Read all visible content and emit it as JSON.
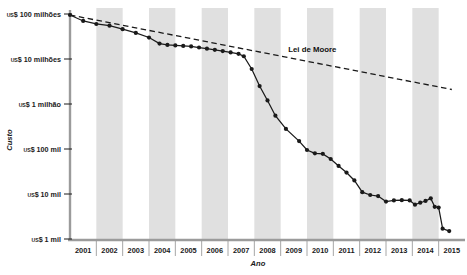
{
  "chart_data": {
    "type": "line",
    "title": "",
    "xlabel": "Ano",
    "ylabel": "Custo",
    "log_scale_y": true,
    "grid": false,
    "legend_position": "inline-annotation",
    "xlim": [
      2001,
      2015
    ],
    "ylim": [
      1000,
      100000000
    ],
    "x_tick_labels": [
      "2001",
      "2002",
      "2003",
      "2004",
      "2005",
      "2006",
      "2007",
      "2008",
      "2009",
      "2010",
      "2011",
      "2012",
      "2013",
      "2014",
      "2015"
    ],
    "y_tick_labels": [
      "US$ 100 milhões",
      "US$ 10 milhões",
      "US$ 1 milhão",
      "US$ 100 mil",
      "US$ 10 mil",
      "US$ 1 mil"
    ],
    "y_tick_values": [
      100000000,
      10000000,
      1000000,
      100000,
      10000,
      1000
    ],
    "y_tick_prefix": "US$",
    "y_tick_suffixes": [
      "100 milhões",
      "10 milhões",
      "1 milhão",
      "100 mil",
      "10 mil",
      "1 mil"
    ],
    "shaded_band_years": [
      "2002",
      "2004",
      "2006",
      "2008",
      "2010",
      "2012",
      "2014"
    ],
    "annotations": [
      {
        "text": "Lei de Moore",
        "x": 2010.2,
        "y": 14000000
      }
    ],
    "series": [
      {
        "name": "Custo do sequenciamento de genoma",
        "style": "line-markers",
        "color": "#1a1a1a",
        "points": [
          {
            "x": 2001.0,
            "y": 95000000
          },
          {
            "x": 2001.5,
            "y": 70000000
          },
          {
            "x": 2002.0,
            "y": 60000000
          },
          {
            "x": 2002.5,
            "y": 55000000
          },
          {
            "x": 2003.0,
            "y": 46000000
          },
          {
            "x": 2003.5,
            "y": 38000000
          },
          {
            "x": 2004.0,
            "y": 30000000
          },
          {
            "x": 2004.4,
            "y": 22000000
          },
          {
            "x": 2004.7,
            "y": 20500000
          },
          {
            "x": 2005.0,
            "y": 20000000
          },
          {
            "x": 2005.3,
            "y": 19500000
          },
          {
            "x": 2005.6,
            "y": 19000000
          },
          {
            "x": 2005.9,
            "y": 18000000
          },
          {
            "x": 2006.2,
            "y": 17000000
          },
          {
            "x": 2006.5,
            "y": 16000000
          },
          {
            "x": 2006.8,
            "y": 15000000
          },
          {
            "x": 2007.1,
            "y": 14000000
          },
          {
            "x": 2007.4,
            "y": 13000000
          },
          {
            "x": 2007.6,
            "y": 11500000
          },
          {
            "x": 2007.9,
            "y": 6000000
          },
          {
            "x": 2008.2,
            "y": 2500000
          },
          {
            "x": 2008.5,
            "y": 1200000
          },
          {
            "x": 2008.8,
            "y": 550000
          },
          {
            "x": 2009.2,
            "y": 280000
          },
          {
            "x": 2009.7,
            "y": 150000
          },
          {
            "x": 2010.0,
            "y": 95000
          },
          {
            "x": 2010.3,
            "y": 80000
          },
          {
            "x": 2010.6,
            "y": 78000
          },
          {
            "x": 2010.9,
            "y": 60000
          },
          {
            "x": 2011.2,
            "y": 42000
          },
          {
            "x": 2011.5,
            "y": 30000
          },
          {
            "x": 2011.8,
            "y": 20000
          },
          {
            "x": 2012.1,
            "y": 11000
          },
          {
            "x": 2012.4,
            "y": 9500
          },
          {
            "x": 2012.7,
            "y": 9000
          },
          {
            "x": 2013.0,
            "y": 6800
          },
          {
            "x": 2013.3,
            "y": 7200
          },
          {
            "x": 2013.6,
            "y": 7300
          },
          {
            "x": 2013.9,
            "y": 7200
          },
          {
            "x": 2014.1,
            "y": 5800
          },
          {
            "x": 2014.3,
            "y": 6400
          },
          {
            "x": 2014.5,
            "y": 7000
          },
          {
            "x": 2014.7,
            "y": 8000
          },
          {
            "x": 2014.85,
            "y": 5200
          },
          {
            "x": 2015.0,
            "y": 5000
          },
          {
            "x": 2015.15,
            "y": 1700
          },
          {
            "x": 2015.4,
            "y": 1500
          }
        ]
      },
      {
        "name": "Lei de Moore",
        "style": "dashed",
        "color": "#1a1a1a",
        "points": [
          {
            "x": 2001.0,
            "y": 95000000
          },
          {
            "x": 2015.5,
            "y": 2100000
          }
        ]
      }
    ]
  }
}
